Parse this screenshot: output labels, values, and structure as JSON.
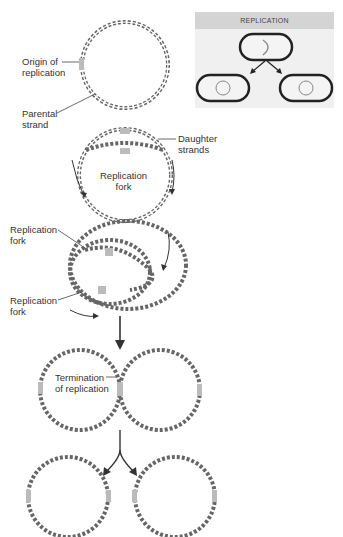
{
  "figure": {
    "inset": {
      "title": "REPLICATION",
      "cells": [
        "parent-cell",
        "daughter-cell-left",
        "daughter-cell-right"
      ]
    },
    "labels": {
      "origin": "Origin of\nreplication",
      "parental": "Parental\nstrand",
      "daughter": "Daughter\nstrands",
      "fork_center": "Replication\nfork",
      "fork_top": "Replication\nfork",
      "fork_bottom": "Replication\nfork",
      "termination": "Termination\nof replication"
    },
    "stages": [
      "single circular parental DNA with origin",
      "replication forks moving bidirectionally",
      "theta structure, two forks",
      "termination of replication, linked circles",
      "two daughter circular DNA molecules"
    ],
    "colors": {
      "strand": "#555555",
      "highlight": "#aaaaaa",
      "arrow": "#333333",
      "inset_bg": "#f0f0f0",
      "inset_header": "#d4d4d4"
    }
  }
}
